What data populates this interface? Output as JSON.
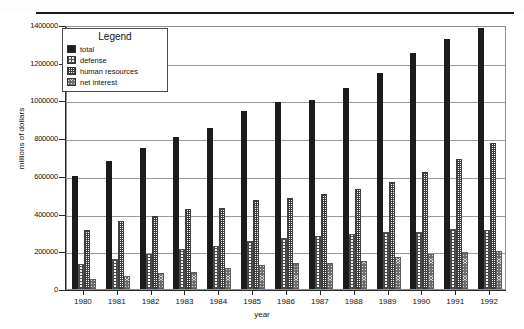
{
  "chart_data": {
    "type": "bar",
    "title": "",
    "xlabel": "year",
    "ylabel": "millions of dollars",
    "categories": [
      "1980",
      "1981",
      "1982",
      "1983",
      "1984",
      "1985",
      "1986",
      "1987",
      "1988",
      "1989",
      "1990",
      "1991",
      "1992"
    ],
    "ylim": [
      0,
      1400000
    ],
    "ytick_values": [
      0,
      200000,
      400000,
      600000,
      800000,
      1000000,
      1200000,
      1400000
    ],
    "ytick_labels": [
      "0",
      "200000",
      "400000",
      "600000",
      "800000",
      "1000000",
      "1200000",
      "1400000"
    ],
    "grid": true,
    "legend_title": "Legend",
    "legend_position": "upper-left-inside",
    "series": [
      {
        "name": "total",
        "swatch": "solid-black",
        "values": [
          600000,
          680000,
          746000,
          808000,
          852000,
          946000,
          990000,
          1004000,
          1064000,
          1143000,
          1253000,
          1324000,
          1382000
        ]
      },
      {
        "name": "defense",
        "swatch": "crosshatch-light",
        "values": [
          134000,
          158000,
          185000,
          210000,
          227000,
          253000,
          273000,
          282000,
          290000,
          304000,
          300000,
          320000,
          314000
        ]
      },
      {
        "name": "human resources",
        "swatch": "dotted-fine",
        "values": [
          313000,
          362000,
          388000,
          426000,
          432000,
          472000,
          482000,
          502000,
          533000,
          568000,
          619000,
          690000,
          772000
        ]
      },
      {
        "name": "net interest",
        "swatch": "checker-gray",
        "values": [
          52000,
          68000,
          84000,
          89000,
          111000,
          129000,
          136000,
          138000,
          151000,
          169000,
          184000,
          194000,
          199000
        ]
      }
    ]
  }
}
